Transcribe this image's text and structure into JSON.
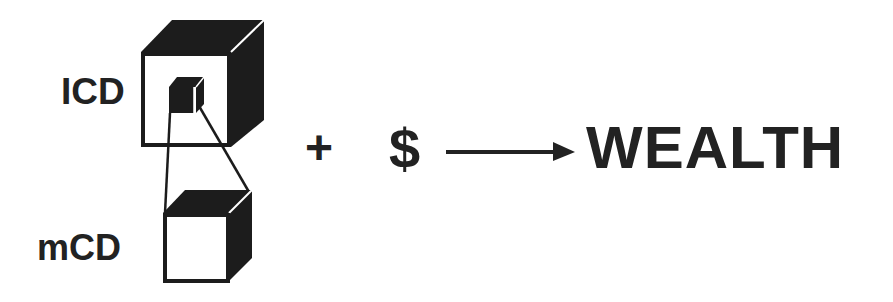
{
  "diagram": {
    "labels": {
      "large_cube": "ICD",
      "small_cube": "mCD",
      "plus": "+",
      "money": "$",
      "result": "WEALTH"
    },
    "elements": {
      "large_cube": "ICD cube containing a small embedded cube",
      "small_cube": "mCD cube, magnified view of the embedded cube",
      "connector": "projection lines from embedded cube to mCD cube",
      "arrow": "right-pointing arrow from $ to WEALTH"
    },
    "colors": {
      "ink": "#222222",
      "background": "#ffffff"
    }
  }
}
